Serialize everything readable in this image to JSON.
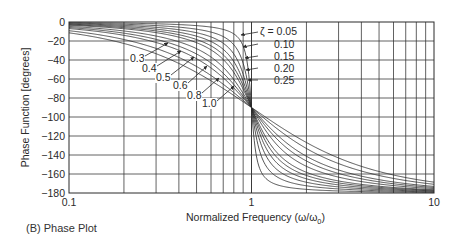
{
  "caption": "(B) Phase Plot",
  "chart_data": {
    "type": "line",
    "title": "",
    "xlabel": "Normalized Frequency (ω/ω0)",
    "xlabel_main": "Normalized Frequency (ω/ω",
    "xlabel_sub": "0",
    "xlabel_close": ")",
    "ylabel": "Phase Function [degrees]",
    "xscale": "log",
    "xlim": [
      0.1,
      10
    ],
    "ylim": [
      -180,
      0
    ],
    "x_ticks": [
      0.1,
      1,
      10
    ],
    "x_tick_labels": [
      "0.1",
      "1",
      "10"
    ],
    "y_ticks": [
      0,
      -20,
      -40,
      -60,
      -80,
      -100,
      -120,
      -140,
      -160,
      -180
    ],
    "y_tick_labels": [
      "0",
      "−20",
      "−40",
      "−60",
      "−80",
      "−100",
      "−120",
      "−140",
      "−160",
      "−180"
    ],
    "grid": true,
    "formula": "phase = -atan2(2*zeta*r, 1 - r^2), r = ω/ω0",
    "series": [
      {
        "name": "ζ = 0.05",
        "zeta": 0.05
      },
      {
        "name": "0.10",
        "zeta": 0.1
      },
      {
        "name": "0.15",
        "zeta": 0.15
      },
      {
        "name": "0.20",
        "zeta": 0.2
      },
      {
        "name": "0.25",
        "zeta": 0.25
      },
      {
        "name": "0.3",
        "zeta": 0.3
      },
      {
        "name": "0.4",
        "zeta": 0.4
      },
      {
        "name": "0.5",
        "zeta": 0.5
      },
      {
        "name": "0.6",
        "zeta": 0.6
      },
      {
        "name": "0.8",
        "zeta": 0.8
      },
      {
        "name": "1.0",
        "zeta": 1.0
      }
    ],
    "sample_points": {
      "x": [
        0.1,
        0.2,
        0.5,
        0.8,
        1,
        1.25,
        2,
        5,
        10
      ],
      "zeta_0.05": [
        -0.6,
        -1.2,
        -3.8,
        -12.5,
        -90,
        -167.5,
        -176.2,
        -178.8,
        -179.4
      ],
      "zeta_0.25": [
        -2.9,
        -6.0,
        -18.4,
        -48.0,
        -90,
        -132.0,
        -161.6,
        -174.0,
        -177.1
      ],
      "zeta_1.0": [
        -11.4,
        -22.6,
        -53.1,
        -77.3,
        -90,
        -102.7,
        -126.9,
        -157.4,
        -168.6
      ]
    },
    "annotations": {
      "right_labels": [
        {
          "text": "ζ = 0.05",
          "zeta": 0.05
        },
        {
          "text": "0.10",
          "zeta": 0.1
        },
        {
          "text": "0.15",
          "zeta": 0.15
        },
        {
          "text": "0.20",
          "zeta": 0.2
        },
        {
          "text": "0.25",
          "zeta": 0.25
        }
      ],
      "left_labels": [
        {
          "text": "0.3",
          "zeta": 0.3
        },
        {
          "text": "0.4",
          "zeta": 0.4
        },
        {
          "text": "0.5",
          "zeta": 0.5
        },
        {
          "text": "0.6",
          "zeta": 0.6
        },
        {
          "text": "0.8",
          "zeta": 0.8
        },
        {
          "text": "1.0",
          "zeta": 1.0
        }
      ]
    },
    "colors": {
      "line": "#2a2a2a",
      "grid": "#3a3a3a",
      "background": "#ffffff"
    }
  }
}
